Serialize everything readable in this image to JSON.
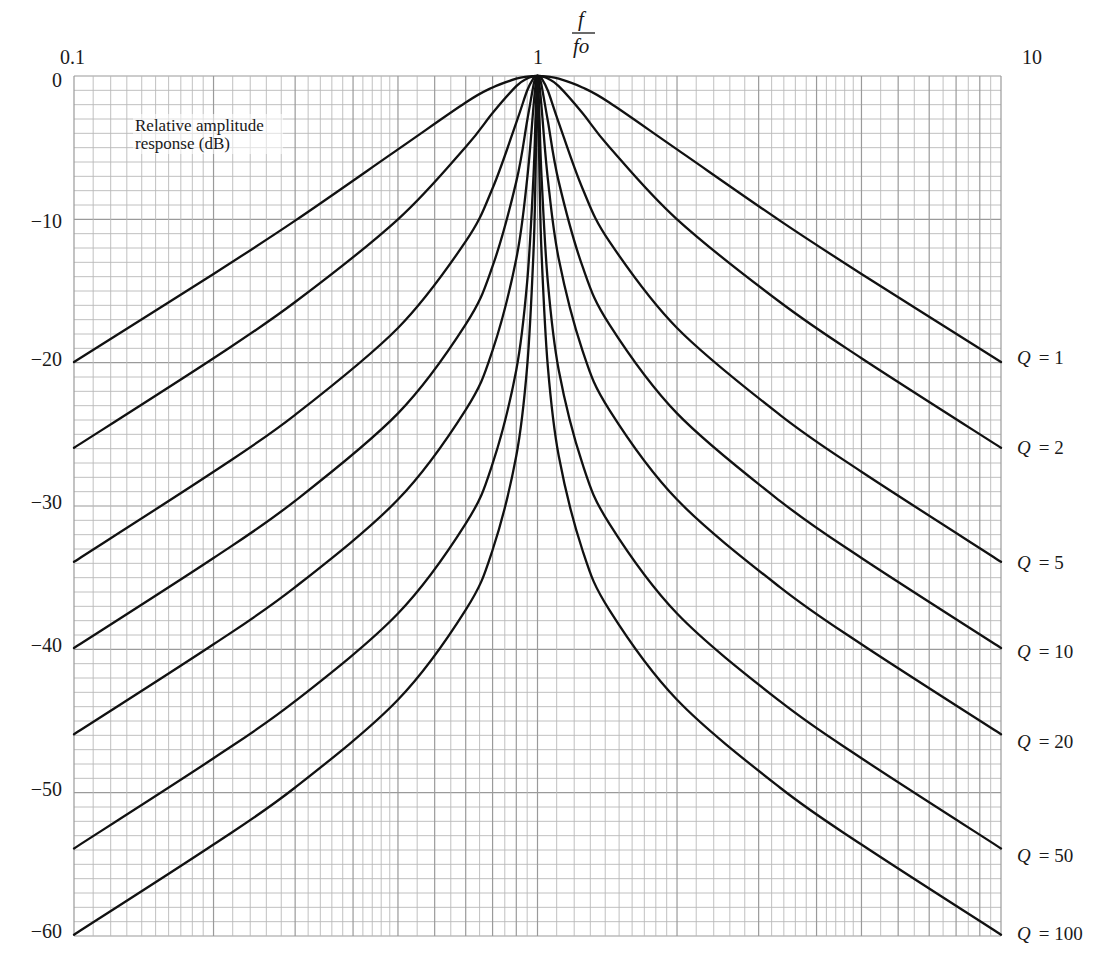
{
  "chart_data": {
    "type": "line",
    "title": "",
    "xlabel": "f / fo",
    "xlabel_numerator": "f",
    "xlabel_denominator": "fo",
    "ylabel": "Relative amplitude response (dB)",
    "ylabel_line1": "Relative amplitude",
    "ylabel_line2": "response (dB)",
    "x_scale": "log",
    "xlim": [
      0.1,
      10
    ],
    "ylim": [
      -60,
      0
    ],
    "grid": true,
    "x_tick_labels": [
      {
        "value": 0.1,
        "label": "0.1"
      },
      {
        "value": 1,
        "label": "1"
      },
      {
        "value": 10,
        "label": "10"
      }
    ],
    "y_tick_labels": [
      {
        "value": 0,
        "label": "0"
      },
      {
        "value": -10,
        "label": "−10"
      },
      {
        "value": -20,
        "label": "−20"
      },
      {
        "value": -30,
        "label": "−30"
      },
      {
        "value": -40,
        "label": "−40"
      },
      {
        "value": -50,
        "label": "−50"
      },
      {
        "value": -60,
        "label": "−60"
      }
    ],
    "legend_position": "right, inline at curve ends",
    "x": [
      0.1,
      0.2,
      0.3,
      0.5,
      0.7,
      0.8,
      0.9,
      0.95,
      0.98,
      0.99,
      0.995,
      0.998,
      1,
      1.002,
      1.005,
      1.0101,
      1.0204,
      1.0526,
      1.1111,
      1.25,
      1.4286,
      2,
      3.3333,
      5,
      10
    ],
    "series": [
      {
        "name": "Q = 1",
        "q_symbol": "Q",
        "q_value": "= 1",
        "values": [
          -19.96,
          -13.81,
          -10.09,
          -5.12,
          -1.85,
          -0.8,
          -0.19,
          -0.05,
          -0.01,
          0,
          0,
          0,
          0,
          0,
          0,
          0,
          -0.01,
          -0.05,
          -0.19,
          -0.8,
          -1.85,
          -5.12,
          -10.09,
          -13.81,
          -19.96
        ]
      },
      {
        "name": "Q = 2",
        "q_symbol": "Q",
        "q_value": "= 2",
        "values": [
          -25.94,
          -19.69,
          -15.77,
          -10.0,
          -4.95,
          -2.58,
          -0.71,
          -0.18,
          -0.03,
          -0.01,
          0,
          0,
          0,
          0,
          0,
          -0.01,
          -0.03,
          -0.18,
          -0.71,
          -2.58,
          -4.95,
          -10.0,
          -15.77,
          -19.69,
          -25.94
        ]
      },
      {
        "name": "Q = 5",
        "q_symbol": "Q",
        "q_value": "= 5",
        "values": [
          -33.89,
          -27.61,
          -23.64,
          -17.58,
          -11.54,
          -7.83,
          -3.25,
          -1.01,
          -0.17,
          -0.04,
          -0.01,
          0,
          0,
          0,
          -0.01,
          -0.04,
          -0.17,
          -1.01,
          -3.25,
          -7.83,
          -11.54,
          -17.58,
          -23.64,
          -27.61,
          -33.89
        ]
      },
      {
        "name": "Q = 10",
        "q_symbol": "Q",
        "q_value": "= 10",
        "values": [
          -39.91,
          -33.63,
          -29.64,
          -23.54,
          -17.33,
          -13.27,
          -7.37,
          -3.12,
          -0.66,
          -0.17,
          -0.04,
          -0.01,
          0,
          -0.01,
          -0.04,
          -0.17,
          -0.66,
          -3.12,
          -7.37,
          -13.27,
          -17.33,
          -23.54,
          -29.64,
          -33.63,
          -39.91
        ]
      },
      {
        "name": "Q = 20",
        "q_symbol": "Q",
        "q_value": "= 20",
        "values": [
          -45.93,
          -39.65,
          -35.66,
          -29.55,
          -23.29,
          -19.14,
          -12.75,
          -7.17,
          -2.18,
          -0.66,
          -0.17,
          -0.03,
          0,
          -0.03,
          -0.17,
          -0.66,
          -2.18,
          -7.17,
          -12.75,
          -19.14,
          -23.29,
          -29.55,
          -35.66,
          -39.65,
          -45.93
        ]
      },
      {
        "name": "Q = 50",
        "q_symbol": "Q",
        "q_value": "= 50",
        "values": [
          -53.89,
          -47.6,
          -43.62,
          -37.5,
          -31.23,
          -27.05,
          -20.51,
          -14.36,
          -7.06,
          -3.03,
          -0.97,
          -0.17,
          0,
          -0.17,
          -0.97,
          -3.03,
          -7.06,
          -14.36,
          -20.51,
          -27.05,
          -31.23,
          -37.5,
          -43.62,
          -47.6,
          -53.89
        ]
      },
      {
        "name": "Q = 100",
        "q_symbol": "Q",
        "q_value": "= 100",
        "values": [
          -59.91,
          -53.62,
          -49.64,
          -43.52,
          -37.25,
          -33.07,
          -26.5,
          -20.26,
          -12.39,
          -7.02,
          -3.02,
          -0.64,
          0,
          -0.64,
          -3.02,
          -7.02,
          -12.39,
          -20.26,
          -26.5,
          -33.07,
          -37.25,
          -43.52,
          -49.64,
          -53.62,
          -59.91
        ]
      }
    ],
    "colors": {
      "curve": "#111111",
      "grid_major": "#9a9a9a",
      "grid_minor": "#b9b9b9",
      "text": "#1a1a1a",
      "background": "#ffffff"
    }
  }
}
